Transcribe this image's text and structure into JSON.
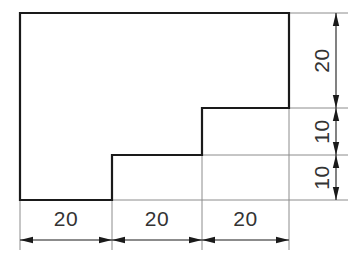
{
  "drawing": {
    "title": "Stepped L-profile orthographic view with linear dimensions",
    "canvas": {
      "width": 354,
      "height": 259,
      "background": "#ffffff"
    },
    "colors": {
      "outline": "#1a1a1a",
      "extension_line": "#8c8c8c",
      "dimension_line": "#1a1a1a",
      "text": "#333333"
    },
    "shape": {
      "name": "stepped-profile",
      "description": "Closed polygon with two descending steps on the right side",
      "vertices": [
        {
          "x": 20,
          "y": 13
        },
        {
          "x": 289,
          "y": 13
        },
        {
          "x": 289,
          "y": 108
        },
        {
          "x": 202,
          "y": 108
        },
        {
          "x": 202,
          "y": 155
        },
        {
          "x": 112,
          "y": 155
        },
        {
          "x": 112,
          "y": 200
        },
        {
          "x": 20,
          "y": 200
        }
      ]
    },
    "dimensions": {
      "horizontal": {
        "axis_label": "bottom",
        "line_y": 240,
        "text_y": 226,
        "segments": [
          {
            "name": "width-segment-left",
            "value": "20",
            "from": 20,
            "to": 112
          },
          {
            "name": "width-segment-middle",
            "value": "20",
            "from": 112,
            "to": 202
          },
          {
            "name": "width-segment-right",
            "value": "20",
            "from": 202,
            "to": 289
          }
        ]
      },
      "vertical": {
        "axis_label": "right",
        "line_x": 336,
        "text_x": 322,
        "segments": [
          {
            "name": "height-segment-top",
            "value": "20",
            "from": 13,
            "to": 108
          },
          {
            "name": "height-segment-middle",
            "value": "10",
            "from": 108,
            "to": 155
          },
          {
            "name": "height-segment-bottom",
            "value": "10",
            "from": 155,
            "to": 200
          }
        ]
      }
    },
    "extension_lines": {
      "horizontal": [
        {
          "name": "ext-line-top-right",
          "x1": 289,
          "y1": 13,
          "x2": 348,
          "y2": 13
        },
        {
          "name": "ext-line-step2-right",
          "x1": 289,
          "y1": 108,
          "x2": 348,
          "y2": 108
        },
        {
          "name": "ext-line-step1-right",
          "x1": 202,
          "y1": 155,
          "x2": 348,
          "y2": 155
        },
        {
          "name": "ext-line-bottom-right",
          "x1": 112,
          "y1": 200,
          "x2": 348,
          "y2": 200
        }
      ],
      "vertical": [
        {
          "name": "ext-line-left-bottom",
          "x1": 20,
          "y1": 200,
          "x2": 20,
          "y2": 250
        },
        {
          "name": "ext-line-step1-bottom",
          "x1": 112,
          "y1": 155,
          "x2": 112,
          "y2": 250
        },
        {
          "name": "ext-line-step2-bottom",
          "x1": 202,
          "y1": 108,
          "x2": 202,
          "y2": 250
        },
        {
          "name": "ext-line-right-bottom",
          "x1": 289,
          "y1": 13,
          "x2": 289,
          "y2": 250
        }
      ]
    }
  }
}
